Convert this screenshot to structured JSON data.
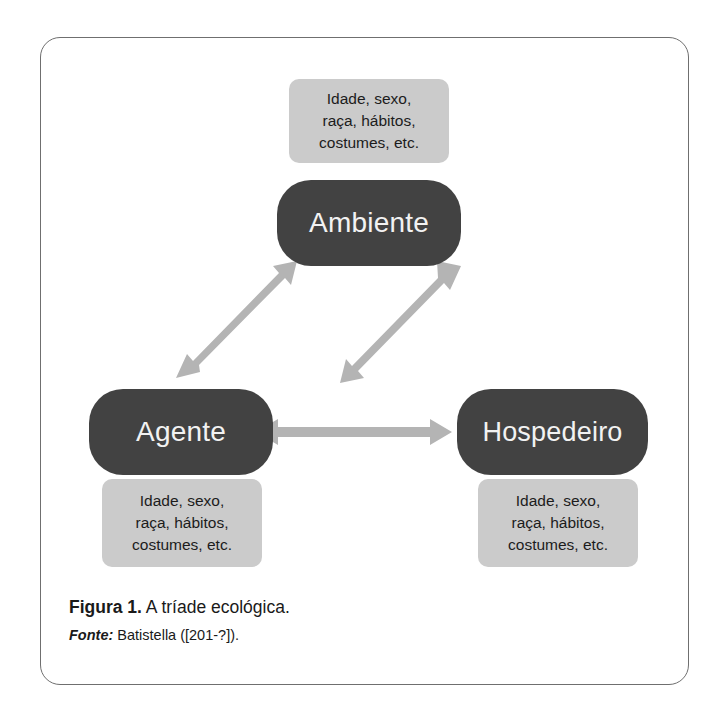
{
  "figure": {
    "frame_border_color": "#6f6f6f",
    "background_color": "#ffffff",
    "node_color": "#424242",
    "node_text_color": "#f2f2f2",
    "attr_box_color": "#cbcbcb",
    "attr_text_color": "#1c1c1c",
    "arrow_color": "#b4b4b4"
  },
  "nodes": {
    "top": {
      "label": "Ambiente"
    },
    "left": {
      "label": "Agente"
    },
    "right": {
      "label": "Hospedeiro"
    }
  },
  "attributes": {
    "ambiente": {
      "lines": [
        "Idade, sexo,",
        "raça, hábitos,",
        "costumes, etc."
      ]
    },
    "agente": {
      "lines": [
        "Idade, sexo,",
        "raça, hábitos,",
        "costumes, etc."
      ]
    },
    "hospedeiro": {
      "lines": [
        "Idade, sexo,",
        "raça, hábitos,",
        "costumes, etc."
      ]
    }
  },
  "arrows": [
    {
      "name": "agente-ambiente",
      "from": "Agente",
      "to": "Ambiente",
      "double_headed": true
    },
    {
      "name": "ambiente-hospedeiro",
      "from": "Ambiente",
      "to": "Hospedeiro",
      "double_headed": true
    },
    {
      "name": "agente-hospedeiro",
      "from": "Agente",
      "to": "Hospedeiro",
      "double_headed": true
    }
  ],
  "caption": {
    "label": "Figura 1.",
    "text": " A tríade ecológica.",
    "source_label": "Fonte:",
    "source_text": " Batistella ([201-?])."
  }
}
